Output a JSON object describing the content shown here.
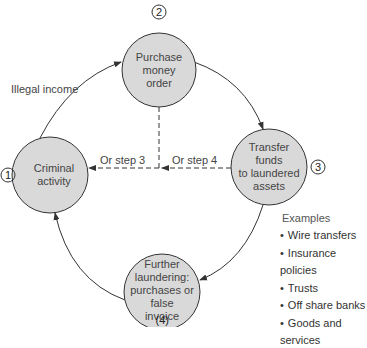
{
  "diagram": {
    "nodes": [
      {
        "id": 1,
        "step": "①",
        "label": "Criminal\nactivity"
      },
      {
        "id": 2,
        "step": "②",
        "label": "Purchase\nmoney\norder"
      },
      {
        "id": 3,
        "step": "③",
        "label": "Transfer\nfunds\nto laundered\nassets"
      },
      {
        "id": 4,
        "step": "(4)",
        "label": "Further\nlaundering:\npurchases or\nfalse\ninvoice"
      }
    ],
    "edges": [
      {
        "from": 1,
        "to": 2,
        "label": "Illegal income",
        "style": "solid"
      },
      {
        "from": 2,
        "to": 3,
        "label": "",
        "style": "solid"
      },
      {
        "from": 3,
        "to": 4,
        "label": "",
        "style": "solid"
      },
      {
        "from": 4,
        "to": 1,
        "label": "",
        "style": "solid"
      },
      {
        "from": 2,
        "to": 1,
        "label": "Or step 3",
        "style": "dashed"
      },
      {
        "from": 3,
        "to": 1,
        "label": "Or step 4",
        "style": "dashed"
      }
    ],
    "examples": {
      "title": "Examples",
      "items": [
        "Wire transfers",
        "Insurance policies",
        "Trusts",
        "Off share banks",
        "Goods and services"
      ]
    },
    "colors": {
      "node_fill": "#d9d9d9",
      "stroke": "#333333"
    }
  }
}
